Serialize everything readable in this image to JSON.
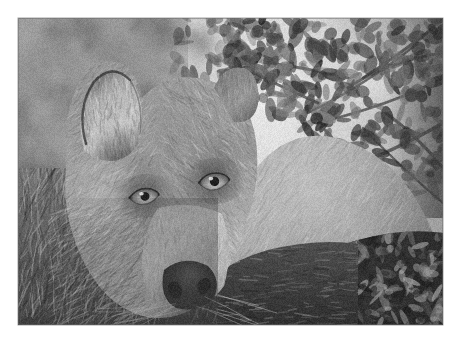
{
  "page": {
    "width": 460,
    "height": 348,
    "background_color": "#ffffff",
    "margin_color": "#ffffff"
  },
  "photo": {
    "subject": "wolf",
    "scene_description": "Grey wolf lying on the forest floor beneath leafy branches, head resting low and facing the camera",
    "color_mode": "grayscale",
    "frame": {
      "left": 18,
      "top": 18,
      "width": 425,
      "height": 307
    },
    "border_color": "#5a5a5a",
    "tone_palette": {
      "highlight": "#ededed",
      "light": "#c9c9c9",
      "midtone": "#9a9a9a",
      "shadow": "#5d5d5d",
      "deep_shadow": "#2f2f2f",
      "black": "#171717"
    },
    "regions": [
      {
        "name": "background-foliage-bokeh",
        "tone": "#b4b4b4"
      },
      {
        "name": "bright-sky-gap",
        "tone": "#e9e9e9"
      },
      {
        "name": "overhanging-leaf-branch",
        "tone": "#4a4a4a"
      },
      {
        "name": "wolf-left-ear",
        "tone": "#9d9d9d"
      },
      {
        "name": "wolf-forehead-fur",
        "tone": "#8f8f8f"
      },
      {
        "name": "wolf-left-eye",
        "tone": "#2b2b2b"
      },
      {
        "name": "wolf-right-eye",
        "tone": "#2b2b2b"
      },
      {
        "name": "wolf-muzzle",
        "tone": "#b0b0b0"
      },
      {
        "name": "wolf-nose",
        "tone": "#3a3a3a"
      },
      {
        "name": "wolf-shoulder-flank",
        "tone": "#a6a6a6"
      },
      {
        "name": "wolf-foreleg",
        "tone": "#9f9f9f"
      },
      {
        "name": "foreground-grass",
        "tone": "#6c6c6c"
      },
      {
        "name": "dark-ground-litter",
        "tone": "#3e3e3e"
      }
    ]
  },
  "chart_data": null
}
